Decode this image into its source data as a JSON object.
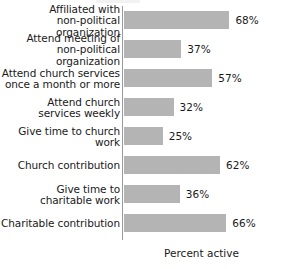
{
  "chart_data": {
    "type": "bar",
    "orientation": "horizontal",
    "title": "",
    "xlabel": "Percent active",
    "ylabel": "",
    "xlim": [
      0,
      100
    ],
    "grid": false,
    "legend": null,
    "value_suffix": "%",
    "bar_color": "#b4b4b4",
    "axis_color": "#9a9a9a",
    "text_color": "#1a1a1a",
    "categories": [
      "Affiliated with\nnon-political organization",
      "Attend meeting of\nnon-political organization",
      "Attend church services\nonce a month or more",
      "Attend church\nservices weekly",
      "Give time to church work",
      "Church contribution",
      "Give time to\ncharitable work",
      "Charitable contribution"
    ],
    "values": [
      68,
      37,
      57,
      32,
      25,
      62,
      36,
      66
    ],
    "value_labels": [
      "68%",
      "37%",
      "57%",
      "32%",
      "25%",
      "62%",
      "36%",
      "66%"
    ]
  }
}
